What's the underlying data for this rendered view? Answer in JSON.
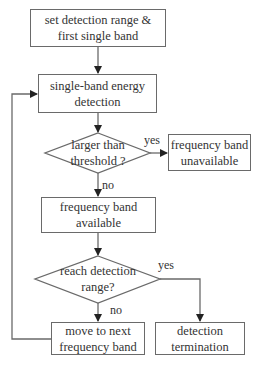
{
  "flowchart": {
    "nodes": {
      "start": {
        "line1": "set detection range &",
        "line2": "first single band"
      },
      "energy": {
        "line1": "single-band energy",
        "line2": "detection"
      },
      "threshold": {
        "line1": "larger than",
        "line2": "threshold ?"
      },
      "unavailable": {
        "line1": "frequency band",
        "line2": "unavailable"
      },
      "available": {
        "line1": "frequency band",
        "line2": "available"
      },
      "range": {
        "line1": "reach detection",
        "line2": "range?"
      },
      "next": {
        "line1": "move to next",
        "line2": "frequency band"
      },
      "termination": {
        "line1": "detection",
        "line2": "termination"
      }
    },
    "edge_labels": {
      "threshold_yes": "yes",
      "threshold_no": "no",
      "range_yes": "yes",
      "range_no": "no"
    },
    "colors": {
      "stroke": "#6a6a6a",
      "arrow": "#222222",
      "text": "#333333"
    }
  }
}
